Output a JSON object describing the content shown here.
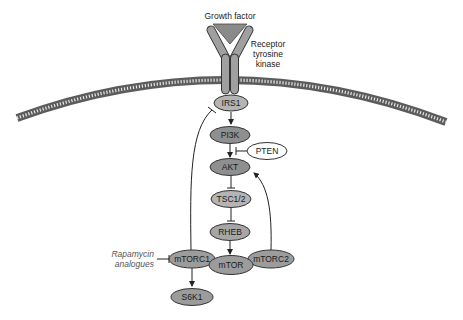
{
  "diagram": {
    "colors": {
      "node_dark": "#8f8f8f",
      "node_light": "#b4b4b4",
      "node_white": "#ffffff",
      "stroke": "#333333",
      "membrane": "#6a6a6a",
      "receptor": "#9a9a9a"
    },
    "labels": {
      "growth_factor": "Growth factor",
      "receptor_line1": "Receptor",
      "receptor_line2": "tyrosine",
      "receptor_line3": "kinase",
      "drug_line1": "Rapamycin",
      "drug_line2": "analogues"
    },
    "nodes": {
      "irs1": "IRS1",
      "pi3k": "PI3K",
      "pten": "PTEN",
      "akt": "AKT",
      "tsc": "TSC1/2",
      "rheb": "RHEB",
      "mtorc1": "mTORC1",
      "mtor": "mTOR",
      "mtorc2": "mTORC2",
      "s6k1": "S6K1"
    },
    "edges": [
      {
        "from": "Growth factor",
        "to": "Receptor tyrosine kinase",
        "type": "binding"
      },
      {
        "from": "IRS1",
        "to": "PI3K",
        "type": "activation"
      },
      {
        "from": "PTEN",
        "to": "PI3K/AKT",
        "type": "inhibition"
      },
      {
        "from": "PI3K",
        "to": "AKT",
        "type": "activation"
      },
      {
        "from": "AKT",
        "to": "TSC1/2",
        "type": "inhibition"
      },
      {
        "from": "TSC1/2",
        "to": "RHEB",
        "type": "inhibition"
      },
      {
        "from": "RHEB",
        "to": "mTOR",
        "type": "activation"
      },
      {
        "from": "mTORC1",
        "to": "S6K1",
        "type": "activation"
      },
      {
        "from": "mTORC1",
        "to": "IRS1",
        "type": "inhibition"
      },
      {
        "from": "mTORC2",
        "to": "AKT",
        "type": "activation"
      },
      {
        "from": "Rapamycin analogues",
        "to": "mTORC1",
        "type": "inhibition"
      }
    ]
  }
}
